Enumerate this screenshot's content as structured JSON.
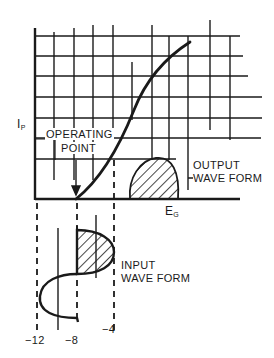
{
  "figure": {
    "type": "vacuum tube transfer characteristic diagram",
    "axis_labels": {
      "y_main": "I",
      "y_sub": "P",
      "x_main": "E",
      "x_sub": "G"
    },
    "annotations": {
      "operating_point_line1": "OPERATING",
      "operating_point_line2": "POINT",
      "output_line1": "OUTPUT",
      "output_line2": "WAVE FORM",
      "input_line1": "INPUT",
      "input_line2": "WAVE FORM"
    },
    "x_ticks": [
      "−12",
      "−8",
      "−4"
    ],
    "colors": {
      "ink": "#1a1a1a",
      "paper": "#ffffff"
    }
  }
}
